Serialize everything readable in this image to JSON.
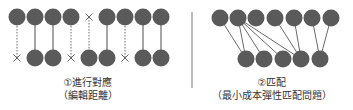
{
  "colors": {
    "node": "#5a5a5a",
    "line": "#6a6a6a",
    "divider": "#777777",
    "text": "#333333"
  },
  "left_panel": {
    "title": "①進行對應",
    "subtitle": "（編輯距離）",
    "top_y": 17,
    "bottom_y": 58,
    "radius": 8.5,
    "columns": [
      {
        "x": 17,
        "top": "node",
        "bottom": "x",
        "link": "dotted"
      },
      {
        "x": 35,
        "top": "node",
        "bottom": "node",
        "link": "solid"
      },
      {
        "x": 53,
        "top": "node",
        "bottom": "node",
        "link": "solid"
      },
      {
        "x": 71,
        "top": "node",
        "bottom": "x",
        "link": "dotted"
      },
      {
        "x": 89,
        "top": "x",
        "bottom": "node",
        "link": "dotted"
      },
      {
        "x": 107,
        "top": "node",
        "bottom": "node",
        "link": "solid"
      },
      {
        "x": 125,
        "top": "node",
        "bottom": "x",
        "link": "dotted"
      },
      {
        "x": 143,
        "top": "node",
        "bottom": "node",
        "link": "solid"
      },
      {
        "x": 161,
        "top": "node",
        "bottom": "node",
        "link": "solid"
      }
    ]
  },
  "right_panel": {
    "title": "②匹配",
    "subtitle": "（最小成本彈性匹配問題）",
    "top_y": 18,
    "bottom_y": 59,
    "radius": 8.5,
    "top_nodes": [
      220,
      238,
      256,
      275,
      294,
      312,
      331
    ],
    "bottom_nodes": [
      246,
      264,
      283,
      301,
      320
    ],
    "edges": [
      [
        0,
        0
      ],
      [
        1,
        0
      ],
      [
        1,
        1
      ],
      [
        1,
        2
      ],
      [
        1,
        3
      ],
      [
        3,
        3
      ],
      [
        4,
        3
      ],
      [
        5,
        4
      ],
      [
        6,
        4
      ]
    ]
  }
}
